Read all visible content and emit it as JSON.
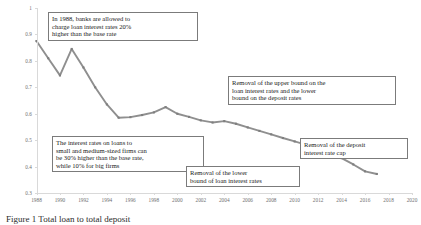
{
  "chart_data": {
    "type": "line",
    "title": "",
    "xlabel": "",
    "ylabel": "",
    "xlim": [
      1988,
      2020
    ],
    "ylim": [
      0.3,
      1.0
    ],
    "grid": false,
    "legend": "none",
    "line_color": "#8f8f8f",
    "marker": "square",
    "x_ticks": [
      1988,
      1990,
      1992,
      1994,
      1996,
      1998,
      2000,
      2002,
      2004,
      2006,
      2008,
      2010,
      2012,
      2014,
      2016,
      2018,
      2020
    ],
    "y_ticks": [
      "0.3",
      "0.4",
      "0.5",
      "0.6",
      "0.7",
      "0.8",
      "0.9",
      "1"
    ],
    "x": [
      1988,
      1989,
      1990,
      1991,
      1992,
      1993,
      1994,
      1995,
      1996,
      1997,
      1998,
      1999,
      2000,
      2001,
      2002,
      2003,
      2004,
      2005,
      2006,
      2007,
      2008,
      2009,
      2010,
      2011,
      2012,
      2013,
      2014,
      2015,
      2016,
      2017
    ],
    "values": [
      0.875,
      0.81,
      0.745,
      0.845,
      0.775,
      0.7,
      0.635,
      0.585,
      0.587,
      0.595,
      0.605,
      0.625,
      0.6,
      0.588,
      0.575,
      0.567,
      0.572,
      0.562,
      0.548,
      0.535,
      0.522,
      0.508,
      0.495,
      0.482,
      0.468,
      0.452,
      0.432,
      0.408,
      0.382,
      0.372
    ]
  },
  "annotations": [
    {
      "id": "annot-1988-loan-rate-premium",
      "lines": [
        "In 1988, banks are allowed to",
        "charge loan interest rates 20%",
        "higher than the base rate"
      ],
      "points_to_year": 1988
    },
    {
      "id": "annot-sme-loan-rate-premium",
      "lines": [
        "The interest rates on loans to",
        "small and medium-sized firms can",
        "be 30% higher than the base rate,",
        "while 10% for big firms"
      ],
      "points_to_year": 1999
    },
    {
      "id": "annot-removal-upper-bound",
      "lines": [
        "Removal of the upper bound on the",
        "loan interest rates and the lower",
        "bound on the deposit rates"
      ],
      "points_to_year": 2004
    },
    {
      "id": "annot-removal-deposit-cap",
      "lines": [
        "Removal of the deposit",
        "interest rate cap"
      ],
      "points_to_year": 2015
    },
    {
      "id": "annot-removal-lower-bound",
      "lines": [
        "Removal of the lower",
        "bound of loan interest rates"
      ],
      "points_to_year": 2013
    }
  ],
  "caption": {
    "text": "Figure 1 Total loan to total deposit"
  }
}
